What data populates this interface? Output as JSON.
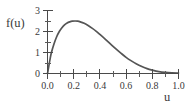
{
  "chart_data": {
    "type": "line",
    "title": "",
    "xlabel": "u",
    "ylabel": "f(u)",
    "xlim": [
      0.0,
      1.0
    ],
    "ylim": [
      0,
      3
    ],
    "grid": false,
    "legend": null,
    "line_color": "#555555",
    "axis_color": "#4a4a4a",
    "background": "#ffffff",
    "xticks": [
      0.0,
      0.2,
      0.4,
      0.6,
      0.8,
      1.0
    ],
    "xtick_labels": [
      "0.0",
      "0.2",
      "0.4",
      "0.6",
      "0.8",
      "1.0"
    ],
    "xminor_ticks": [
      0.1,
      0.3,
      0.5,
      0.7,
      0.9
    ],
    "yticks": [
      0,
      1,
      2,
      3
    ],
    "ytick_labels": [
      "0",
      "1",
      "2",
      "3"
    ],
    "yminor_ticks": [
      0.5,
      1.5,
      2.5
    ],
    "peak": {
      "x": 0.21,
      "y": 2.5
    },
    "x": [
      0.0,
      0.01,
      0.02,
      0.03,
      0.05,
      0.07,
      0.09,
      0.11,
      0.13,
      0.15,
      0.17,
      0.19,
      0.21,
      0.23,
      0.25,
      0.28,
      0.31,
      0.34,
      0.37,
      0.4,
      0.44,
      0.48,
      0.52,
      0.56,
      0.6,
      0.64,
      0.68,
      0.72,
      0.76,
      0.8,
      0.85,
      0.9,
      0.95,
      1.0
    ],
    "y": [
      0.0,
      0.35,
      0.7,
      1.0,
      1.42,
      1.75,
      2.0,
      2.18,
      2.32,
      2.41,
      2.46,
      2.49,
      2.5,
      2.49,
      2.46,
      2.39,
      2.29,
      2.16,
      2.02,
      1.86,
      1.64,
      1.41,
      1.18,
      0.97,
      0.77,
      0.6,
      0.45,
      0.33,
      0.23,
      0.16,
      0.09,
      0.05,
      0.03,
      0.02
    ]
  },
  "labels": {
    "y_axis_label": "f(u)",
    "x_axis_label": "u",
    "y_tick_3": "3",
    "y_tick_2": "2",
    "y_tick_1": "1",
    "y_tick_0": "0",
    "x_tick_0": "0.0",
    "x_tick_1": "0.2",
    "x_tick_2": "0.4",
    "x_tick_3": "0.6",
    "x_tick_4": "0.8",
    "x_tick_5": "1.0"
  }
}
